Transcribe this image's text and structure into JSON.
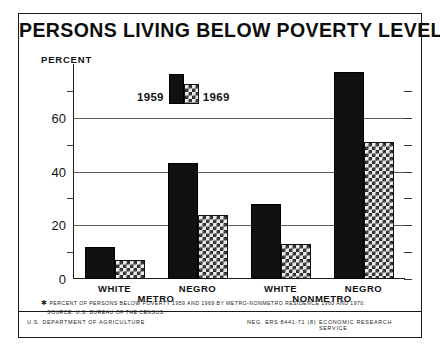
{
  "title": "PERSONS LIVING BELOW POVERTY LEVEL*",
  "axis": {
    "percent_label": "PERCENT",
    "tick_labels": [
      "0",
      "20",
      "40",
      "60"
    ],
    "minor_ticks": [
      10,
      30,
      50,
      70
    ]
  },
  "legend": {
    "series_1_label": "1959",
    "series_2_label": "1969"
  },
  "footnote": {
    "marker": "✱",
    "line1": "PERCENT OF PERSONS BELOW POVERTY 1959 AND 1969 BY METRO-NONMETRO RESIDENCE 1960 AND 1970.",
    "line2": "SOURCE: U.S. BUREAU OF THE CENSUS."
  },
  "credit": {
    "left": "U.S. DEPARTMENT OF AGRICULTURE",
    "neg": "NEG. ERS 8441-71 (8)",
    "right": "ECONOMIC RESEARCH SERVICE"
  },
  "chart_data": {
    "type": "bar",
    "title": "PERSONS LIVING BELOW POVERTY LEVEL*",
    "xlabel": "",
    "ylabel": "PERCENT",
    "ylim": [
      0,
      80
    ],
    "yticks": [
      0,
      20,
      40,
      60
    ],
    "grid": true,
    "legend_position": "top-center",
    "categories": [
      "WHITE",
      "NEGRO",
      "WHITE",
      "NEGRO"
    ],
    "groups": [
      "METRO",
      "METRO",
      "NONMETRO",
      "NONMETRO"
    ],
    "group_labels": [
      "METRO",
      "NONMETRO"
    ],
    "series": [
      {
        "name": "1959",
        "values": [
          12,
          43,
          28,
          77
        ]
      },
      {
        "name": "1969",
        "values": [
          7,
          24,
          13,
          51
        ]
      }
    ]
  }
}
